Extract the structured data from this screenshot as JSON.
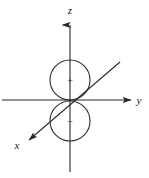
{
  "figure": {
    "name": "p-orbital-axes-diagram",
    "background_color": "#ffffff",
    "stroke_color": "#2a2a2a",
    "width": 149,
    "height": 178
  },
  "axes": {
    "z": {
      "label": "z",
      "label_x": 70,
      "label_y": 13,
      "arrow": "up",
      "line_x1": 70,
      "line_y1": 16,
      "line_x2": 70,
      "line_y2": 172
    },
    "y": {
      "label": "y",
      "label_x": 139,
      "label_y": 104,
      "arrow": "right",
      "line_x1": 2,
      "line_y1": 100,
      "line_x2": 133,
      "line_y2": 100
    },
    "x": {
      "label": "x",
      "label_x": 17,
      "label_y": 148,
      "arrow": "down-left",
      "line_x1": 120,
      "line_y1": 62,
      "line_x2": 26,
      "line_y2": 142
    }
  },
  "lobes": [
    {
      "name": "upper-lobe",
      "sign": "+",
      "center_x": 70,
      "center_y": 80,
      "radius": 20,
      "sign_x": 70,
      "sign_y": 83
    },
    {
      "name": "lower-lobe",
      "sign": "−",
      "center_x": 70,
      "center_y": 121,
      "radius": 20,
      "sign_x": 70,
      "sign_y": 124
    }
  ]
}
